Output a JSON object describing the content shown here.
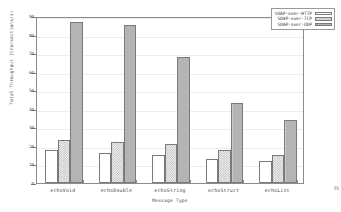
{
  "chart_data": {
    "type": "bar",
    "title": "",
    "xlabel": "Message Type",
    "ylabel": "Total Throughput (transactions/s)",
    "categories": [
      "echoVoid",
      "echoDouble",
      "echoString",
      "echoStruct",
      "echoList"
    ],
    "series": [
      {
        "name": "SOAP-over-HTTP",
        "values": [
          18,
          16,
          15,
          13,
          12
        ],
        "fill": "empty",
        "color": "#ffffff"
      },
      {
        "name": "SOAP-over-TCP",
        "values": [
          23,
          22,
          21,
          18,
          15
        ],
        "fill": "checker",
        "color": "#f2f2f2"
      },
      {
        "name": "SOAP-over-UDP",
        "values": [
          87,
          85,
          68,
          43,
          34
        ],
        "fill": "solid",
        "color": "#b4b4b4"
      }
    ],
    "ylim": [
      0,
      90
    ],
    "yticks": [
      0,
      10,
      20,
      30,
      40,
      50,
      60,
      70,
      80,
      90
    ],
    "ytick_labels": [
      "0",
      "10",
      "20",
      "30",
      "40",
      "50",
      "60",
      "70",
      "80",
      "90"
    ],
    "grid": true,
    "legend_position": "top-right"
  },
  "annotations": {
    "corner_note": "75"
  }
}
